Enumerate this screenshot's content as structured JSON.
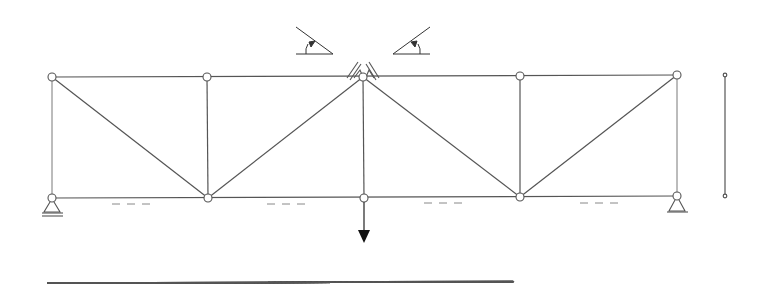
{
  "diagram": {
    "type": "truss",
    "stroke_color": "#555555",
    "node_fill": "#ffffff",
    "nodes": {
      "top": [
        {
          "id": "T1",
          "x": 52,
          "y": 77
        },
        {
          "id": "T2",
          "x": 207,
          "y": 77
        },
        {
          "id": "T3",
          "x": 363,
          "y": 77
        },
        {
          "id": "T4",
          "x": 520,
          "y": 76
        },
        {
          "id": "T5",
          "x": 677,
          "y": 75
        }
      ],
      "bottom": [
        {
          "id": "B1",
          "x": 52,
          "y": 198
        },
        {
          "id": "B2",
          "x": 208,
          "y": 198
        },
        {
          "id": "B3",
          "x": 364,
          "y": 198
        },
        {
          "id": "B4",
          "x": 520,
          "y": 197
        },
        {
          "id": "B5",
          "x": 677,
          "y": 196
        }
      ]
    },
    "angle_labels": {
      "left": "36,87°",
      "right": "36,87°"
    },
    "support_labels": {
      "top_left": "LC",
      "top_right": "LD",
      "bottom_left": "LE",
      "bottom_right": "LB"
    },
    "load": {
      "node_label": "7",
      "value": "300 kn"
    },
    "height_dim": {
      "value": "3"
    },
    "span_dims": [
      {
        "value": "4"
      },
      {
        "value": "4"
      },
      {
        "value": "4"
      },
      {
        "value": "4"
      }
    ]
  }
}
